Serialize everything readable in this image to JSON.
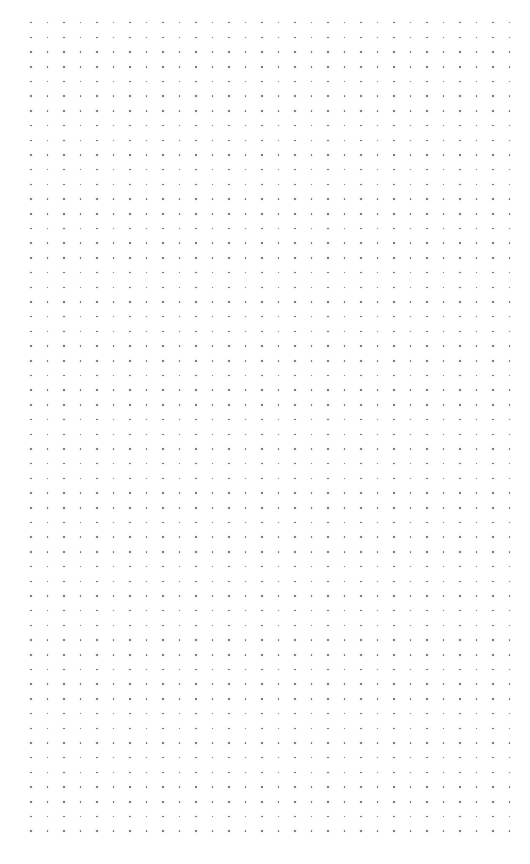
{
  "page": {
    "type": "dot-grid-paper",
    "background_color": "#ffffff"
  },
  "dot_grid": {
    "columns": 30,
    "rows": 56,
    "origin_x": 31,
    "origin_y": 22.7,
    "spacing_x": 16.5,
    "spacing_y": 14.7,
    "dot_color": "#6a6a6a",
    "dot_size": 1.6
  }
}
